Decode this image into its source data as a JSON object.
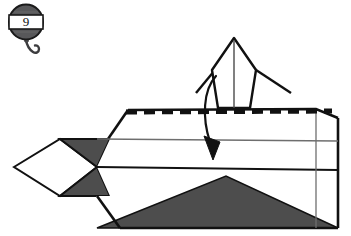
{
  "diagram": {
    "step_badge": {
      "number": "9",
      "shape": "oval-badge-with-hook",
      "band_fill": "#ffffff",
      "badge_fill": "#58585a",
      "badge_stroke": "#1a1a1a",
      "hook_name": "hook-icon"
    },
    "colors": {
      "paper_front": "#ffffff",
      "paper_back": "#4d4d4d",
      "line": "#111111",
      "thin_line": "#6e6e6e",
      "fold_dash": "#111111",
      "arrow": "#111111"
    },
    "annotations": {
      "fold_line_type": "valley-fold-dashed",
      "arrow_type": "fold-over-curved-arrow",
      "arrow_direction": "downward"
    },
    "shapes": {
      "body_outline": "105,118 128,108 235,108 318,107 338,117 338,228 120,228 96,196 60,196 60,140 96,140",
      "left_white_diamond": "14,167 60,139 96,167 60,196",
      "left_dark_upper": "60,139 108,139 96,167",
      "left_dark_lower": "60,196 96,167 108,196",
      "bottom_dark_triangle": "96,228 226,176 338,228",
      "upright_flap_left": "218,94 212,66 234,38 234,94",
      "upright_flap_right": "234,38 256,66 250,94 234,94",
      "flap_wing_left": "197,72 218,94",
      "flap_wing_right": "256,66 290,94",
      "center_crease": "234,38 234,108",
      "dashed_fold_y": 112,
      "dashed_fold_x_start": 126,
      "dashed_fold_x_end": 330,
      "thin_line_1_y": 140,
      "thin_line_2_y": 167,
      "right_vertical_x": 316
    }
  }
}
